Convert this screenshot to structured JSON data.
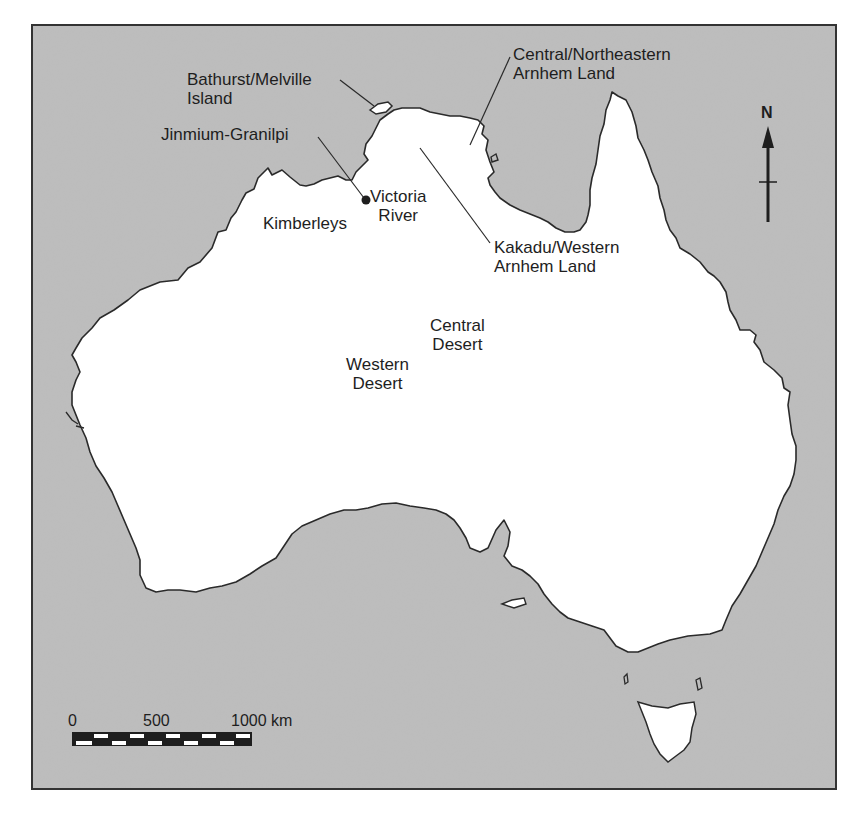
{
  "map": {
    "region": "Australia",
    "colors": {
      "sea": "#bdbdbd",
      "land": "#ffffff",
      "coast": "#2a2a2a",
      "frame": "#333333",
      "text": "#1e1e1e"
    },
    "labels": {
      "bathurst_line1": "Bathurst/Melville",
      "bathurst_line2": "Island",
      "jinmium": "Jinmium-Granilpi",
      "victoria_line1": "Victoria",
      "victoria_line2": "River",
      "kimberleys": "Kimberleys",
      "central_ne_line1": "Central/Northeastern",
      "central_ne_line2": "Arnhem Land",
      "kakadu_line1": "Kakadu/Western",
      "kakadu_line2": "Arnhem Land",
      "central_desert_line1": "Central",
      "central_desert_line2": "Desert",
      "western_desert_line1": "Western",
      "western_desert_line2": "Desert"
    },
    "north_arrow": {
      "label": "N"
    },
    "scale_bar": {
      "ticks": [
        "0",
        "500",
        "1000 km"
      ],
      "unit": "km",
      "max": 1000
    }
  }
}
